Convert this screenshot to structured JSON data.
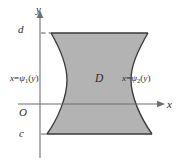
{
  "figure": {
    "kind": "math-diagram",
    "background_color": "#ffffff",
    "region_fill_color": "#b3b3b3",
    "region_outline_color": "#3a3a3a",
    "axis_color": "#6f6f6f",
    "text_color": "#2b2b2b"
  },
  "axes": {
    "y_axis_label": "y",
    "x_axis_label": "x",
    "origin_label": "O"
  },
  "ticks": {
    "upper_bound_label": "d",
    "lower_bound_label": "c",
    "upper_guide_style": "dashed",
    "lower_guide_style": "solid"
  },
  "region": {
    "label": "D"
  },
  "curves": {
    "left": {
      "prefix": "x",
      "equals": "=",
      "function_symbol": "ψ",
      "subscript": "1",
      "open_paren": "(",
      "argument": "y",
      "close_paren": ")"
    },
    "right": {
      "prefix": "x",
      "equals": "=",
      "function_symbol": "ψ",
      "subscript": "2",
      "open_paren": "(",
      "argument": "y",
      "close_paren": ")"
    }
  },
  "geometry": {
    "y_axis_x": 40,
    "x_axis_y": 104,
    "d_level_y": 33,
    "c_level_y": 134,
    "top_left_x": 51,
    "top_right_x": 148,
    "bottom_left_x": 47,
    "bottom_right_x": 152,
    "waist_left_x": 67,
    "waist_right_x": 131,
    "waist_y": 80
  }
}
